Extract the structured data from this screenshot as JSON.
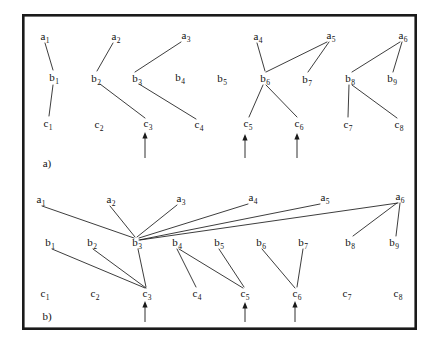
{
  "figure": {
    "width": 436,
    "height": 349,
    "background": "#ffffff",
    "ink_color": "#1a1a1a",
    "border": {
      "x": 22,
      "y": 14,
      "width": 395,
      "height": 316,
      "stroke_width": 2.6,
      "color": "#1a1a1a"
    },
    "caption_a": "a)",
    "caption_b": "b)"
  },
  "chart_data": {
    "type": "diagram",
    "title": "",
    "panels": [
      {
        "id": "a",
        "caption": "a)",
        "caption_pos": {
          "x": 47,
          "y": 163
        },
        "rows": [
          {
            "row": "a",
            "nodes": [
              {
                "id": "a1",
                "label": "a",
                "sub": "1",
                "x": 45,
                "y": 36
              },
              {
                "id": "a2",
                "label": "a",
                "sub": "2",
                "x": 116,
                "y": 36
              },
              {
                "id": "a3",
                "label": "a",
                "sub": "3",
                "x": 186,
                "y": 35
              },
              {
                "id": "a4",
                "label": "a",
                "sub": "4",
                "x": 258,
                "y": 36
              },
              {
                "id": "a5",
                "label": "a",
                "sub": "5",
                "x": 331,
                "y": 35
              },
              {
                "id": "a6",
                "label": "a",
                "sub": "6",
                "x": 403,
                "y": 35
              }
            ]
          },
          {
            "row": "b",
            "nodes": [
              {
                "id": "b1",
                "label": "b",
                "sub": "1",
                "x": 54,
                "y": 77
              },
              {
                "id": "b2",
                "label": "b",
                "sub": "2",
                "x": 96,
                "y": 78
              },
              {
                "id": "b3",
                "label": "b",
                "sub": "3",
                "x": 137,
                "y": 78
              },
              {
                "id": "b4",
                "label": "b",
                "sub": "4",
                "x": 180,
                "y": 77
              },
              {
                "id": "b5",
                "label": "b",
                "sub": "5",
                "x": 222,
                "y": 78
              },
              {
                "id": "b6",
                "label": "b",
                "sub": "6",
                "x": 265,
                "y": 78
              },
              {
                "id": "b7",
                "label": "b",
                "sub": "7",
                "x": 307,
                "y": 79
              },
              {
                "id": "b8",
                "label": "b",
                "sub": "8",
                "x": 350,
                "y": 78
              },
              {
                "id": "b9",
                "label": "b",
                "sub": "9",
                "x": 392,
                "y": 78
              }
            ]
          },
          {
            "row": "c",
            "nodes": [
              {
                "id": "c1",
                "label": "c",
                "sub": "1",
                "x": 48,
                "y": 123
              },
              {
                "id": "c2",
                "label": "c",
                "sub": "2",
                "x": 99,
                "y": 124
              },
              {
                "id": "c3",
                "label": "c",
                "sub": "3",
                "x": 148,
                "y": 123
              },
              {
                "id": "c4",
                "label": "c",
                "sub": "4",
                "x": 199,
                "y": 124
              },
              {
                "id": "c5",
                "label": "c",
                "sub": "5",
                "x": 248,
                "y": 123
              },
              {
                "id": "c6",
                "label": "c",
                "sub": "6",
                "x": 299,
                "y": 123
              },
              {
                "id": "c7",
                "label": "c",
                "sub": "7",
                "x": 348,
                "y": 124
              },
              {
                "id": "c8",
                "label": "c",
                "sub": "8",
                "x": 399,
                "y": 124
              }
            ]
          }
        ],
        "edges": [
          {
            "from": "a1",
            "to": "b1",
            "x1": 45,
            "y1": 43,
            "x2": 53,
            "y2": 70
          },
          {
            "from": "a2",
            "to": "b2",
            "x1": 113,
            "y1": 43,
            "x2": 97,
            "y2": 71
          },
          {
            "from": "b1",
            "to": "c1",
            "x1": 53,
            "y1": 85,
            "x2": 49,
            "y2": 116
          },
          {
            "from": "b2",
            "to": "c3",
            "x1": 100,
            "y1": 84,
            "x2": 145,
            "y2": 118
          },
          {
            "from": "a3",
            "to": "b3",
            "x1": 181,
            "y1": 42,
            "x2": 135,
            "y2": 72
          },
          {
            "from": "b3",
            "to": "c4",
            "x1": 139,
            "y1": 84,
            "x2": 196,
            "y2": 119
          },
          {
            "from": "a4",
            "to": "b6",
            "x1": 257,
            "y1": 43,
            "x2": 265,
            "y2": 71
          },
          {
            "from": "a5",
            "to": "b6",
            "x1": 327,
            "y1": 42,
            "x2": 266,
            "y2": 72
          },
          {
            "from": "a5",
            "to": "b7",
            "x1": 329,
            "y1": 42,
            "x2": 308,
            "y2": 72
          },
          {
            "from": "b6",
            "to": "c5",
            "x1": 263,
            "y1": 85,
            "x2": 249,
            "y2": 117
          },
          {
            "from": "b6",
            "to": "c6",
            "x1": 266,
            "y1": 85,
            "x2": 297,
            "y2": 117
          },
          {
            "from": "a6",
            "to": "b8",
            "x1": 400,
            "y1": 42,
            "x2": 352,
            "y2": 72
          },
          {
            "from": "a6",
            "to": "b9",
            "x1": 402,
            "y1": 42,
            "x2": 393,
            "y2": 72
          },
          {
            "from": "b8",
            "to": "c7",
            "x1": 349,
            "y1": 85,
            "x2": 348,
            "y2": 117
          },
          {
            "from": "b8",
            "to": "c8",
            "x1": 352,
            "y1": 85,
            "x2": 397,
            "y2": 118
          }
        ],
        "arrows": [
          {
            "marks": "c3",
            "x": 145,
            "y_tip": 132,
            "y_tail": 158
          },
          {
            "marks": "c5",
            "x": 245,
            "y_tip": 134,
            "y_tail": 158
          },
          {
            "marks": "c6",
            "x": 297,
            "y_tip": 133,
            "y_tail": 158
          }
        ]
      },
      {
        "id": "b",
        "caption": "b)",
        "caption_pos": {
          "x": 47,
          "y": 316
        },
        "rows": [
          {
            "row": "a",
            "nodes": [
              {
                "id": "a1",
                "label": "a",
                "sub": "1",
                "x": 41,
                "y": 199
              },
              {
                "id": "a2",
                "label": "a",
                "sub": "2",
                "x": 111,
                "y": 199
              },
              {
                "id": "a3",
                "label": "a",
                "sub": "3",
                "x": 181,
                "y": 198
              },
              {
                "id": "a4",
                "label": "a",
                "sub": "4",
                "x": 253,
                "y": 197
              },
              {
                "id": "a5",
                "label": "a",
                "sub": "5",
                "x": 325,
                "y": 197
              },
              {
                "id": "a6",
                "label": "a",
                "sub": "6",
                "x": 400,
                "y": 196
              }
            ]
          },
          {
            "row": "b",
            "nodes": [
              {
                "id": "b1",
                "label": "b",
                "sub": "1",
                "x": 50,
                "y": 242
              },
              {
                "id": "b2",
                "label": "b",
                "sub": "2",
                "x": 92,
                "y": 242
              },
              {
                "id": "b3",
                "label": "b",
                "sub": "3",
                "x": 137,
                "y": 242
              },
              {
                "id": "b4",
                "label": "b",
                "sub": "4",
                "x": 177,
                "y": 242
              },
              {
                "id": "b5",
                "label": "b",
                "sub": "5",
                "x": 219,
                "y": 242
              },
              {
                "id": "b6",
                "label": "b",
                "sub": "6",
                "x": 261,
                "y": 242
              },
              {
                "id": "b7",
                "label": "b",
                "sub": "7",
                "x": 303,
                "y": 242
              },
              {
                "id": "b8",
                "label": "b",
                "sub": "8",
                "x": 350,
                "y": 242
              },
              {
                "id": "b9",
                "label": "b",
                "sub": "9",
                "x": 394,
                "y": 242
              }
            ]
          },
          {
            "row": "c",
            "nodes": [
              {
                "id": "c1",
                "label": "c",
                "sub": "1",
                "x": 45,
                "y": 293
              },
              {
                "id": "c2",
                "label": "c",
                "sub": "2",
                "x": 95,
                "y": 293
              },
              {
                "id": "c3",
                "label": "c",
                "sub": "3",
                "x": 147,
                "y": 293
              },
              {
                "id": "c4",
                "label": "c",
                "sub": "4",
                "x": 197,
                "y": 293
              },
              {
                "id": "c5",
                "label": "c",
                "sub": "5",
                "x": 245,
                "y": 293
              },
              {
                "id": "c6",
                "label": "c",
                "sub": "6",
                "x": 297,
                "y": 293
              },
              {
                "id": "c7",
                "label": "c",
                "sub": "7",
                "x": 347,
                "y": 293
              },
              {
                "id": "c8",
                "label": "c",
                "sub": "8",
                "x": 398,
                "y": 293
              }
            ]
          }
        ],
        "edges": [
          {
            "from": "a1",
            "to": "b3",
            "x1": 42,
            "y1": 206,
            "x2": 134,
            "y2": 238
          },
          {
            "from": "a2",
            "to": "b3",
            "x1": 110,
            "y1": 206,
            "x2": 135,
            "y2": 237
          },
          {
            "from": "a3",
            "to": "b3",
            "x1": 177,
            "y1": 205,
            "x2": 137,
            "y2": 237
          },
          {
            "from": "a4",
            "to": "b3",
            "x1": 248,
            "y1": 204,
            "x2": 139,
            "y2": 238
          },
          {
            "from": "a5",
            "to": "b3",
            "x1": 320,
            "y1": 204,
            "x2": 139,
            "y2": 240
          },
          {
            "from": "a6",
            "to": "b3",
            "x1": 398,
            "y1": 203,
            "x2": 140,
            "y2": 240
          },
          {
            "from": "a6",
            "to": "b8",
            "x1": 397,
            "y1": 203,
            "x2": 353,
            "y2": 236
          },
          {
            "from": "a6",
            "to": "b9",
            "x1": 400,
            "y1": 203,
            "x2": 396,
            "y2": 236
          },
          {
            "from": "b1",
            "to": "c3",
            "x1": 52,
            "y1": 249,
            "x2": 145,
            "y2": 288
          },
          {
            "from": "b2",
            "to": "c3",
            "x1": 93,
            "y1": 249,
            "x2": 146,
            "y2": 288
          },
          {
            "from": "b3",
            "to": "c3",
            "x1": 138,
            "y1": 249,
            "x2": 146,
            "y2": 287
          },
          {
            "from": "b4",
            "to": "c4",
            "x1": 177,
            "y1": 249,
            "x2": 196,
            "y2": 287
          },
          {
            "from": "b4",
            "to": "c5",
            "x1": 179,
            "y1": 249,
            "x2": 243,
            "y2": 288
          },
          {
            "from": "b5",
            "to": "c5",
            "x1": 219,
            "y1": 249,
            "x2": 244,
            "y2": 287
          },
          {
            "from": "b6",
            "to": "c6",
            "x1": 262,
            "y1": 249,
            "x2": 295,
            "y2": 288
          },
          {
            "from": "b7",
            "to": "c6",
            "x1": 303,
            "y1": 249,
            "x2": 297,
            "y2": 287
          }
        ],
        "arrows": [
          {
            "marks": "c3",
            "x": 145,
            "y_tip": 301,
            "y_tail": 322
          },
          {
            "marks": "c5",
            "x": 245,
            "y_tip": 302,
            "y_tail": 322
          },
          {
            "marks": "c6",
            "x": 295,
            "y_tip": 301,
            "y_tail": 322
          }
        ]
      }
    ]
  }
}
